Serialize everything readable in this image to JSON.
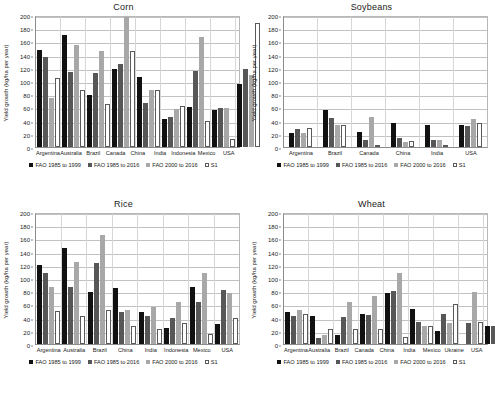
{
  "figure": {
    "ylabel": "Yield growth (kg/ha per year)",
    "ytick_labels": [
      "200",
      "180",
      "160",
      "140",
      "120",
      "100",
      "80",
      "60",
      "40",
      "20",
      "0"
    ],
    "legend": [
      {
        "label": "FAO 1985 to 1999",
        "color": "#111111"
      },
      {
        "label": "FAO 1985 to 2016",
        "color": "#575757"
      },
      {
        "label": "FAO 2000 to 2016",
        "color": "#a8a8a8"
      },
      {
        "label": "S1",
        "color": "#ffffff"
      }
    ],
    "caption": ""
  },
  "chart_data": [
    {
      "type": "bar",
      "title": "Corn",
      "xlabel": "",
      "ylabel": "Yield growth (kg/ha per year)",
      "ylim": [
        0,
        200
      ],
      "ytick_step": 20,
      "grid": true,
      "legend_position": "bottom",
      "categories": [
        "Argentina",
        "Australia",
        "Brazil",
        "Canada",
        "China",
        "India",
        "Indonesia",
        "Mexico",
        "USA"
      ],
      "series": [
        {
          "name": "FAO 1985 to 1999",
          "values": [
            147,
            170,
            79,
            118,
            106,
            43,
            60,
            56,
            95
          ]
        },
        {
          "name": "FAO 1985 to 2016",
          "values": [
            136,
            114,
            112,
            126,
            66,
            46,
            115,
            59,
            118
          ]
        },
        {
          "name": "FAO 2000 to 2016",
          "values": [
            74,
            155,
            146,
            197,
            86,
            58,
            167,
            59,
            109
          ]
        },
        {
          "name": "S1",
          "values": [
            105,
            86,
            65,
            146,
            87,
            62,
            40,
            12,
            188
          ]
        }
      ]
    },
    {
      "type": "bar",
      "title": "Soybeans",
      "xlabel": "",
      "ylabel": "Yield growth (kg/ha per year)",
      "ylim": [
        0,
        200
      ],
      "ytick_step": 20,
      "grid": true,
      "legend_position": "bottom",
      "categories": [
        "Argentina",
        "Brazil",
        "Canada",
        "China",
        "India",
        "USA"
      ],
      "series": [
        {
          "name": "FAO 1985 to 1999",
          "values": [
            21,
            56,
            22,
            36,
            33,
            33
          ]
        },
        {
          "name": "FAO 1985 to 2016",
          "values": [
            28,
            44,
            11,
            13,
            11,
            32
          ]
        },
        {
          "name": "FAO 2000 to 2016",
          "values": [
            21,
            33,
            46,
            8,
            11,
            43
          ]
        },
        {
          "name": "S1",
          "values": [
            29,
            33,
            3,
            9,
            2,
            36
          ]
        }
      ]
    },
    {
      "type": "bar",
      "title": "Rice",
      "xlabel": "",
      "ylabel": "Yield growth (kg/ha per year)",
      "ylim": [
        0,
        200
      ],
      "ytick_step": 20,
      "grid": true,
      "legend_position": "bottom",
      "categories": [
        "Argentina",
        "Australia",
        "Brazil",
        "China",
        "India",
        "Indonesia",
        "Mexico",
        "USA"
      ],
      "series": [
        {
          "name": "FAO 1985 to 1999",
          "values": [
            119,
            145,
            79,
            85,
            49,
            25,
            86,
            30
          ]
        },
        {
          "name": "FAO 1985 to 2016",
          "values": [
            108,
            87,
            122,
            49,
            43,
            39,
            63,
            82
          ]
        },
        {
          "name": "FAO 2000 to 2016",
          "values": [
            86,
            124,
            165,
            52,
            56,
            64,
            108,
            77
          ]
        },
        {
          "name": "S1",
          "values": [
            50,
            42,
            51,
            27,
            22,
            32,
            15,
            40
          ]
        }
      ]
    },
    {
      "type": "bar",
      "title": "Wheat",
      "xlabel": "",
      "ylabel": "Yield growth (kg/ha per year)",
      "ylim": [
        0,
        200
      ],
      "ytick_step": 20,
      "grid": true,
      "legend_position": "bottom",
      "categories": [
        "Argentina",
        "Australia",
        "Brazil",
        "Canada",
        "China",
        "India",
        "Mexico",
        "Ukraine",
        "USA"
      ],
      "series": [
        {
          "name": "FAO 1985 to 1999",
          "values": [
            48,
            43,
            14,
            46,
            78,
            53,
            19,
            0,
            27
          ]
        },
        {
          "name": "FAO 1985 to 2016",
          "values": [
            42,
            9,
            41,
            44,
            81,
            34,
            46,
            32,
            28
          ]
        },
        {
          "name": "FAO 2000 to 2016",
          "values": [
            51,
            14,
            64,
            73,
            107,
            28,
            32,
            79,
            34
          ]
        },
        {
          "name": "S1",
          "values": [
            45,
            22,
            23,
            22,
            11,
            27,
            60,
            34,
            24
          ]
        }
      ]
    }
  ]
}
